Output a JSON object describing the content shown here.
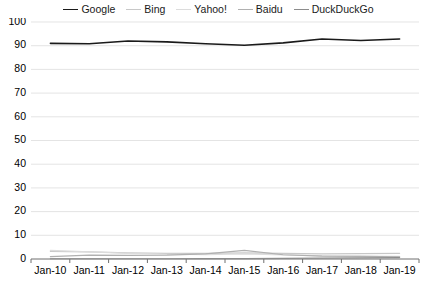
{
  "legend": {
    "position": "top-center",
    "items": [
      {
        "label": "Google",
        "color": "#1a1a1a"
      },
      {
        "label": "Bing",
        "color": "#c8c8c8"
      },
      {
        "label": "Yahoo!",
        "color": "#dcdcdc"
      },
      {
        "label": "Baidu",
        "color": "#b0b0b0"
      },
      {
        "label": "DuckDuckGo",
        "color": "#8c8c8c"
      }
    ]
  },
  "axis": {
    "y_ticks": [
      "0",
      "10",
      "20",
      "30",
      "40",
      "50",
      "60",
      "70",
      "80",
      "90",
      "100"
    ],
    "x_ticks": [
      "Jan-10",
      "Jan-11",
      "Jan-12",
      "Jan-13",
      "Jan-14",
      "Jan-15",
      "Jan-16",
      "Jan-17",
      "Jan-18",
      "Jan-19"
    ]
  },
  "chart_data": {
    "type": "line",
    "title": "",
    "subtitle": "",
    "xlabel": "",
    "ylabel": "",
    "grid": true,
    "legend_position": "top-center",
    "ylim": [
      0,
      100
    ],
    "ytick_step": 10,
    "categories": [
      "Jan-10",
      "Jan-11",
      "Jan-12",
      "Jan-13",
      "Jan-14",
      "Jan-15",
      "Jan-16",
      "Jan-17",
      "Jan-18",
      "Jan-19"
    ],
    "series": [
      {
        "name": "Google",
        "color": "#1a1a1a",
        "width": 1.6,
        "values": [
          91.0,
          90.8,
          92.0,
          91.6,
          90.8,
          90.2,
          91.2,
          92.8,
          92.2,
          92.8
        ]
      },
      {
        "name": "Bing",
        "color": "#c8c8c8",
        "width": 1.2,
        "values": [
          3.2,
          3.0,
          2.6,
          2.4,
          2.4,
          2.6,
          2.4,
          2.2,
          2.3,
          2.4
        ]
      },
      {
        "name": "Yahoo!",
        "color": "#dcdcdc",
        "width": 1.2,
        "values": [
          3.6,
          3.0,
          2.4,
          2.0,
          1.8,
          2.2,
          1.7,
          1.3,
          1.2,
          1.1
        ]
      },
      {
        "name": "Baidu",
        "color": "#b0b0b0",
        "width": 1.2,
        "values": [
          1.0,
          1.6,
          1.5,
          1.6,
          2.2,
          3.6,
          1.8,
          1.2,
          1.1,
          0.9
        ]
      },
      {
        "name": "DuckDuckGo",
        "color": "#8c8c8c",
        "width": 1.2,
        "values": [
          0.1,
          0.1,
          0.1,
          0.1,
          0.2,
          0.2,
          0.3,
          0.4,
          0.5,
          0.6
        ]
      }
    ]
  }
}
